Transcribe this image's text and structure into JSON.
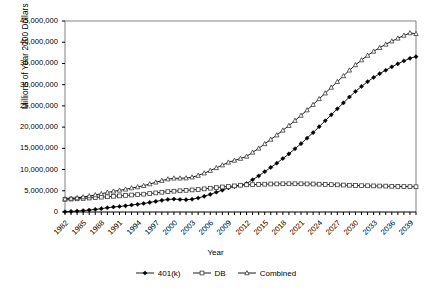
{
  "chart_data": {
    "type": "line",
    "title": "",
    "xlabel": "Year",
    "ylabel": "Millions of Year 2000 Dollars",
    "xlim": [
      1982,
      2040
    ],
    "ylim": [
      0,
      45000000
    ],
    "ytick_step": 5000000,
    "grid": false,
    "legend_position": "bottom",
    "ytick_labels": [
      "45,000,000",
      "40,000,000",
      "35,000,000",
      "30,000,000",
      "25,000,000",
      "20,000,000",
      "15,000,000",
      "10,000,000",
      "5,000,000",
      "0"
    ],
    "ytick_values": [
      45000000,
      40000000,
      35000000,
      30000000,
      25000000,
      20000000,
      15000000,
      10000000,
      5000000,
      0
    ],
    "xtick_labels": [
      "1982",
      "1985",
      "1988",
      "1991",
      "1994",
      "1997",
      "2000",
      "2003",
      "2006",
      "2009",
      "2012",
      "2015",
      "2018",
      "2021",
      "2024",
      "2027",
      "2030",
      "2033",
      "2036",
      "2039"
    ],
    "xtick_values": [
      1982,
      1985,
      1988,
      1991,
      1994,
      1997,
      2000,
      2003,
      2006,
      2009,
      2012,
      2015,
      2018,
      2021,
      2024,
      2027,
      2030,
      2033,
      2036,
      2039
    ],
    "x": [
      1982,
      1983,
      1984,
      1985,
      1986,
      1987,
      1988,
      1989,
      1990,
      1991,
      1992,
      1993,
      1994,
      1995,
      1996,
      1997,
      1998,
      1999,
      2000,
      2001,
      2002,
      2003,
      2004,
      2005,
      2006,
      2007,
      2008,
      2009,
      2010,
      2011,
      2012,
      2013,
      2014,
      2015,
      2016,
      2017,
      2018,
      2019,
      2020,
      2021,
      2022,
      2023,
      2024,
      2025,
      2026,
      2027,
      2028,
      2029,
      2030,
      2031,
      2032,
      2033,
      2034,
      2035,
      2036,
      2037,
      2038,
      2039,
      2040
    ],
    "series": [
      {
        "name": "401(k)",
        "marker": "filled-diamond",
        "values": [
          60000,
          130000,
          220000,
          330000,
          460000,
          610000,
          790000,
          1000000,
          1180000,
          1300000,
          1450000,
          1650000,
          1800000,
          2000000,
          2250000,
          2500000,
          2750000,
          2950000,
          3050000,
          2950000,
          2900000,
          3000000,
          3300000,
          3700000,
          4150000,
          4650000,
          5150000,
          5700000,
          6000000,
          6300000,
          6700000,
          7600000,
          8500000,
          9500000,
          10500000,
          11500000,
          12600000,
          13700000,
          14900000,
          16100000,
          17400000,
          18700000,
          20100000,
          21500000,
          22900000,
          24300000,
          25700000,
          27100000,
          28400000,
          29600000,
          30700000,
          31700000,
          32600000,
          33400000,
          34200000,
          34900000,
          35600000,
          36200000,
          36600000
        ]
      },
      {
        "name": "DB",
        "marker": "open-square",
        "values": [
          3000000,
          3050000,
          3100000,
          3200000,
          3300000,
          3400000,
          3500000,
          3600000,
          3700000,
          3800000,
          3900000,
          4000000,
          4100000,
          4200000,
          4350000,
          4500000,
          4650000,
          4800000,
          4900000,
          5000000,
          5100000,
          5200000,
          5300000,
          5450000,
          5600000,
          5750000,
          5900000,
          6000000,
          6150000,
          6300000,
          6400000,
          6450000,
          6500000,
          6550000,
          6600000,
          6620000,
          6650000,
          6650000,
          6650000,
          6650000,
          6620000,
          6600000,
          6550000,
          6500000,
          6450000,
          6400000,
          6350000,
          6300000,
          6250000,
          6200000,
          6180000,
          6150000,
          6120000,
          6100000,
          6050000,
          6020000,
          6000000,
          5980000,
          5950000
        ]
      },
      {
        "name": "Combined",
        "marker": "open-triangle",
        "values": [
          3060000,
          3180000,
          3320000,
          3530000,
          3760000,
          4010000,
          4290000,
          4600000,
          4880000,
          5100000,
          5350000,
          5650000,
          5900000,
          6200000,
          6600000,
          7000000,
          7400000,
          7750000,
          7950000,
          7950000,
          8000000,
          8200000,
          8600000,
          9150000,
          9750000,
          10400000,
          11050000,
          11700000,
          12150000,
          12600000,
          13100000,
          14050000,
          15000000,
          16050000,
          17100000,
          18120000,
          19250000,
          20350000,
          21550000,
          22750000,
          24020000,
          25300000,
          26650000,
          28000000,
          29350000,
          30700000,
          32050000,
          33400000,
          34650000,
          35800000,
          36880000,
          37850000,
          38720000,
          39500000,
          40250000,
          40920000,
          41600000,
          42180000,
          42000000
        ]
      }
    ]
  },
  "legend": {
    "items": [
      {
        "label": "401(k)",
        "marker": "filled-diamond"
      },
      {
        "label": "DB",
        "marker": "open-square"
      },
      {
        "label": "Combined",
        "marker": "open-triangle"
      }
    ]
  }
}
